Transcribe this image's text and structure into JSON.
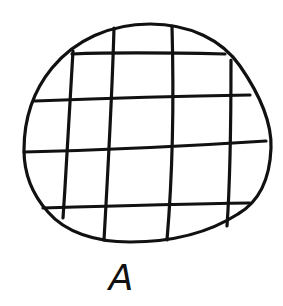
{
  "diagram": {
    "label": "A",
    "stroke_color": "#111111",
    "background": "#ffffff",
    "shape": "rounded-blob",
    "grid": {
      "vertical_lines": 4,
      "horizontal_lines": 4
    }
  }
}
